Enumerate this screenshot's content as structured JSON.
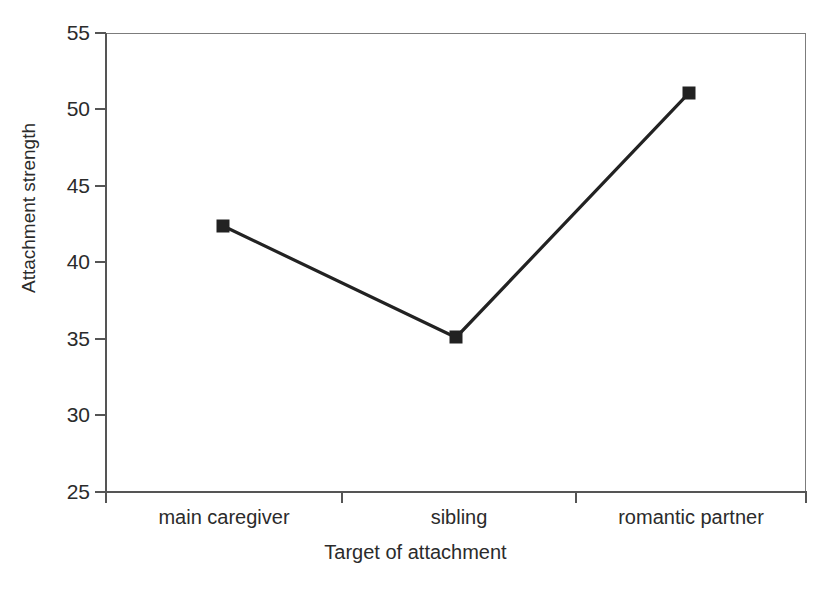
{
  "chart_data": {
    "type": "line",
    "title": "",
    "xlabel": "Target of attachment",
    "ylabel": "Attachment strength",
    "categories": [
      "main caregiver",
      "sibling",
      "romantic partner"
    ],
    "values": [
      42.4,
      35.1,
      51.1
    ],
    "series": [
      {
        "name": "Attachment strength",
        "values": [
          42.4,
          35.1,
          51.1
        ]
      }
    ],
    "ylim": [
      25,
      55
    ],
    "yticks": [
      25,
      30,
      35,
      40,
      45,
      50,
      55
    ],
    "ytick_labels": [
      "25",
      "30",
      "35",
      "40",
      "45",
      "50",
      "55"
    ],
    "xtick_labels": [
      "main caregiver",
      "sibling",
      "romantic partner"
    ],
    "grid": false,
    "legend": false,
    "legend_position": "none",
    "marker": "filled-square",
    "line_color": "#222222",
    "marker_color": "#222222",
    "axis_color": "#555555",
    "frame_color": "#7c7c7c",
    "background_color": "#ffffff"
  },
  "axes": {
    "y": {
      "title": "Attachment strength",
      "ticks": [
        {
          "value": 55,
          "label": "55"
        },
        {
          "value": 50,
          "label": "50"
        },
        {
          "value": 45,
          "label": "45"
        },
        {
          "value": 40,
          "label": "40"
        },
        {
          "value": 35,
          "label": "35"
        },
        {
          "value": 30,
          "label": "30"
        },
        {
          "value": 25,
          "label": "25"
        }
      ]
    },
    "x": {
      "title": "Target of attachment",
      "categories": [
        {
          "label": "main caregiver"
        },
        {
          "label": "sibling"
        },
        {
          "label": "romantic partner"
        }
      ]
    }
  }
}
